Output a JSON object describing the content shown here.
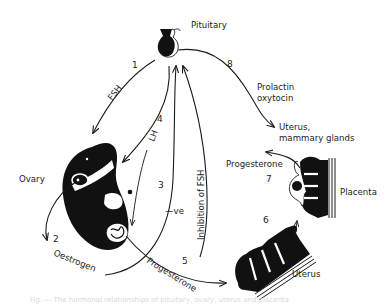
{
  "diagram": {
    "organs": {
      "pituitary": "Pituitary",
      "ovary": "Ovary",
      "uterus_mammary_line1": "Uterus,",
      "uterus_mammary_line2": "mammary glands",
      "placenta": "Placenta",
      "uterus": "Uterus"
    },
    "pathways": [
      {
        "number": "1",
        "label": "FSH",
        "from": "Pituitary",
        "to": "Ovary"
      },
      {
        "number": "2",
        "label": "Oestrogen",
        "from": "Ovary",
        "to": "Pituitary"
      },
      {
        "number": "3",
        "label": "—ve",
        "from": "Ovary",
        "to": "Pituitary"
      },
      {
        "number": "4",
        "label": "LH",
        "from": "Pituitary",
        "to": "Ovary"
      },
      {
        "number": "5",
        "label": "Inhibition of FSH",
        "from": "Uterus",
        "to": "Pituitary"
      },
      {
        "number": "6",
        "label": "",
        "from": "Uterus",
        "to": "Placenta"
      },
      {
        "number": "7",
        "label": "Progesterone",
        "from": "Placenta",
        "to": "Pituitary"
      },
      {
        "number": "8",
        "label": "Prolactin oxytocin",
        "from": "Pituitary",
        "to": "Uterus, mammary glands"
      }
    ],
    "labels": {
      "n1": "1",
      "n2": "2",
      "n3": "3",
      "n4": "4",
      "n5": "5",
      "n6": "6",
      "n7": "7",
      "n8": "8",
      "fsh": "FSH",
      "lh": "LH",
      "negative": "—ve",
      "inhibition_fsh": "Inhibition of FSH",
      "oestrogen": "Oestrogen",
      "progesterone_ovary": "Progesterone",
      "progesterone_placenta": "Progesterone",
      "prolactin": "Prolactin",
      "oxytocin": "oxytocin"
    },
    "caption": "Fig. — The hormonal relationships of pituitary, ovary, uterus and placenta"
  }
}
